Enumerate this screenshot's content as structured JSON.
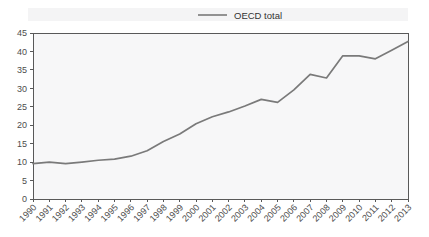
{
  "chart_data": {
    "type": "line",
    "title": "",
    "subtitle": "",
    "xlabel": "",
    "ylabel": "",
    "categories": [
      "1990",
      "1991",
      "1992",
      "1993",
      "1994",
      "1995",
      "1996",
      "1997",
      "1998",
      "1999",
      "2000",
      "2001",
      "2002",
      "2003",
      "2004",
      "2005",
      "2006",
      "2007",
      "2008",
      "2009",
      "2010",
      "2011",
      "2012",
      "2013"
    ],
    "series": [
      {
        "name": "OECD total",
        "color": "#7a7a7a",
        "values": [
          9.6,
          10.0,
          9.6,
          10.0,
          10.5,
          10.8,
          11.6,
          13.1,
          15.6,
          17.6,
          20.4,
          22.3,
          23.6,
          25.2,
          27.0,
          26.2,
          29.6,
          33.8,
          32.8,
          38.8,
          38.8,
          38.0,
          40.3,
          42.7
        ]
      }
    ],
    "ylim": [
      0,
      45
    ],
    "yticks": [
      0,
      5,
      10,
      15,
      20,
      25,
      30,
      35,
      40,
      45
    ],
    "ytick_labels": [
      "0",
      "5",
      "10",
      "15",
      "20",
      "25",
      "30",
      "35",
      "40",
      "45"
    ],
    "xtick_labels": [
      "1990",
      "1991",
      "1992",
      "1993",
      "1994",
      "1995",
      "1996",
      "1997",
      "1998",
      "1999",
      "2000",
      "2001",
      "2002",
      "2003",
      "2004",
      "2005",
      "2006",
      "2007",
      "2008",
      "2009",
      "2010",
      "2011",
      "2012",
      "2013"
    ],
    "xtick_rotation": -45,
    "grid": false,
    "legend": {
      "position": "top-center",
      "entries": [
        {
          "label": "OECD total",
          "color": "#7a7a7a",
          "marker": "line"
        }
      ]
    },
    "axis_color": "#595959",
    "plot_background": "#f7f7f8",
    "figure_background": "#ffffff"
  }
}
